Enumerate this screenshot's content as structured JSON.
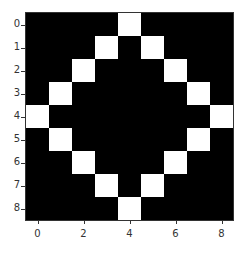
{
  "chart_data": {
    "type": "heatmap",
    "title": "",
    "xlabel": "",
    "ylabel": "",
    "rows": 9,
    "cols": 9,
    "colormap": "gray",
    "values": [
      [
        0,
        0,
        0,
        0,
        1,
        0,
        0,
        0,
        0
      ],
      [
        0,
        0,
        0,
        1,
        0,
        1,
        0,
        0,
        0
      ],
      [
        0,
        0,
        1,
        0,
        0,
        0,
        1,
        0,
        0
      ],
      [
        0,
        1,
        0,
        0,
        0,
        0,
        0,
        1,
        0
      ],
      [
        1,
        0,
        0,
        0,
        0,
        0,
        0,
        0,
        1
      ],
      [
        0,
        1,
        0,
        0,
        0,
        0,
        0,
        1,
        0
      ],
      [
        0,
        0,
        1,
        0,
        0,
        0,
        1,
        0,
        0
      ],
      [
        0,
        0,
        0,
        1,
        0,
        1,
        0,
        0,
        0
      ],
      [
        0,
        0,
        0,
        0,
        1,
        0,
        0,
        0,
        0
      ]
    ],
    "xticks": [
      "0",
      "2",
      "4",
      "6",
      "8"
    ],
    "xtick_positions": [
      0,
      2,
      4,
      6,
      8
    ],
    "yticks": [
      "0",
      "1",
      "2",
      "3",
      "4",
      "5",
      "6",
      "7",
      "8"
    ],
    "ytick_positions": [
      0,
      1,
      2,
      3,
      4,
      5,
      6,
      7,
      8
    ],
    "xlim": [
      -0.5,
      8.5
    ],
    "ylim": [
      8.5,
      -0.5
    ],
    "grid": false,
    "colors": {
      "on": "#ffffff",
      "off": "#000000"
    }
  }
}
